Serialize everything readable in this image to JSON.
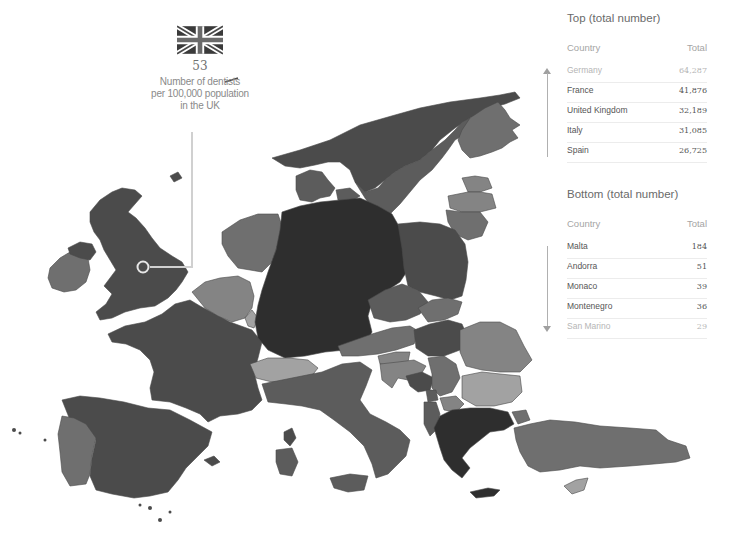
{
  "callout": {
    "country": "United Kingdom",
    "flag_icon": "uk-flag-icon",
    "value": "53",
    "label_lines": [
      "Number of dentists",
      "per 100,000 population",
      "in the UK"
    ]
  },
  "top_table": {
    "title": "Top (total number)",
    "columns": [
      "Country",
      "Total"
    ],
    "rows": [
      {
        "country": "Germany",
        "total": "64,287"
      },
      {
        "country": "France",
        "total": "41,876"
      },
      {
        "country": "United Kingdom",
        "total": "32,189"
      },
      {
        "country": "Italy",
        "total": "31,085"
      },
      {
        "country": "Spain",
        "total": "26,725"
      }
    ]
  },
  "bottom_table": {
    "title": "Bottom (total number)",
    "columns": [
      "Country",
      "Total"
    ],
    "rows": [
      {
        "country": "Malta",
        "total": "184"
      },
      {
        "country": "Andorra",
        "total": "51"
      },
      {
        "country": "Monaco",
        "total": "39"
      },
      {
        "country": "Montenegro",
        "total": "36"
      },
      {
        "country": "San Marino",
        "total": "29"
      }
    ]
  },
  "map": {
    "highlighted_country": "United Kingdom",
    "shade_colors": {
      "darkest": "#2e2e2e",
      "dark": "#4b4b4b",
      "mid_dark": "#5c5c5c",
      "mid": "#6f6f6f",
      "mid_light": "#848484",
      "light": "#a2a2a2",
      "lightest": "#b8b8b8"
    },
    "callout_line_color": "#c8c8c8"
  }
}
